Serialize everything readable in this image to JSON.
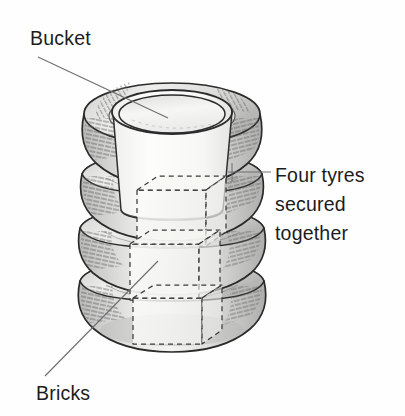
{
  "figure": {
    "background_color": "#fefefe",
    "ink_color": "#1c1c1c"
  },
  "labels": {
    "bucket": "Bucket",
    "bricks": "Bricks",
    "tyres_line1": "Four tyres",
    "tyres_line2": "secured",
    "tyres_line3": "together"
  },
  "diagram": {
    "object_name": "stack-of-four-tyres-with-bucket-and-bricks",
    "components": [
      {
        "name": "tyre-top",
        "description": "Topmost tyre ring, shaded grey with hatching at left and right shoulders"
      },
      {
        "name": "tyre-second",
        "description": "Second tyre ring from top"
      },
      {
        "name": "tyre-third",
        "description": "Third tyre ring from top"
      },
      {
        "name": "tyre-bottom",
        "description": "Bottom tyre ring resting on the ground"
      },
      {
        "name": "bucket",
        "description": "Tapered bucket inserted down the centre of the tyre stack, open mouth visible at top"
      },
      {
        "name": "bricks",
        "description": "Three bricks drawn as hidden dashed outlines stacked inside the tyre column below the bucket"
      }
    ],
    "leader_lines": [
      {
        "name": "bucket-leader",
        "from": [
          38,
          57
        ],
        "to": [
          168,
          118
        ]
      },
      {
        "name": "tyres-leader",
        "from": [
          271,
          172
        ],
        "to": [
          228,
          172
        ]
      },
      {
        "name": "bricks-leader",
        "from": [
          45,
          376
        ],
        "to": [
          158,
          261
        ]
      }
    ],
    "colors": {
      "outline": "#2a2a2a",
      "tyre_fill_light": "#f3f3f1",
      "tyre_fill_mid": "#d6d6d4",
      "tyre_fill_dark": "#bcbcba",
      "bucket_fill": "#fbfbfa",
      "hatch": "#4a4a4a",
      "dashed_brick": "#3a3a3a",
      "leader": "#6f6f70"
    }
  }
}
